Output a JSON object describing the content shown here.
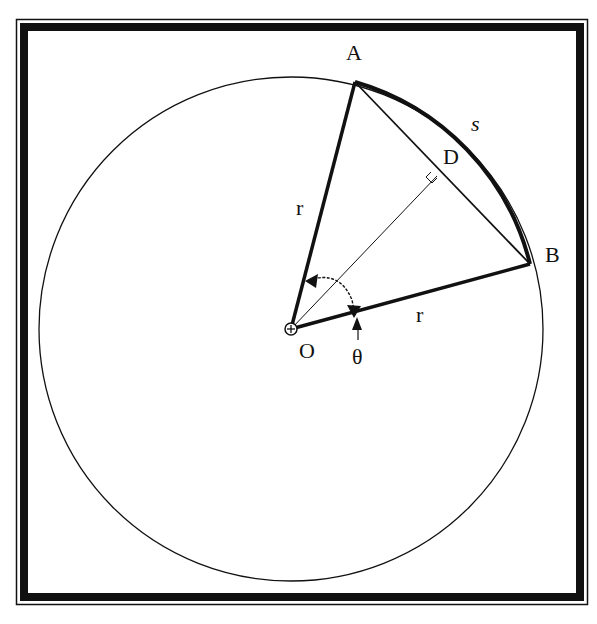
{
  "diagram": {
    "labels": {
      "A": "A",
      "B": "B",
      "D": "D",
      "O": "O",
      "s": "s",
      "r_upper": "r",
      "r_lower": "r",
      "theta": "θ"
    },
    "points": {
      "O": [
        291,
        329
      ],
      "A": [
        355,
        82
      ],
      "B": [
        530,
        264
      ],
      "D": [
        437,
        176
      ]
    },
    "circle": {
      "cx": 291,
      "cy": 329,
      "r": 252
    },
    "colors": {
      "stroke": "#111111",
      "background": "#ffffff"
    }
  }
}
